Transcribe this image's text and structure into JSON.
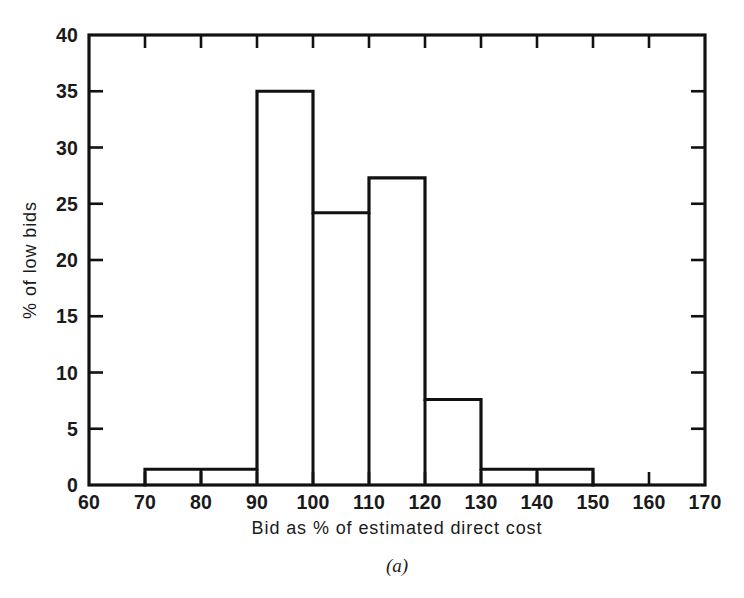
{
  "figure": {
    "caption": "(a)",
    "background_color": "#ffffff",
    "ink_color": "#111111"
  },
  "chart_data": {
    "type": "bar",
    "subtype": "histogram",
    "title": "",
    "subtitle": "",
    "xlabel": "Bid as % of estimated direct cost",
    "ylabel": "% of low bids",
    "xlim": [
      60,
      170
    ],
    "ylim": [
      0,
      40
    ],
    "x_tick_step": 10,
    "y_tick_step": 5,
    "grid": false,
    "legend": null,
    "bin_width": 10,
    "bin_edges": [
      60,
      70,
      80,
      90,
      100,
      110,
      120,
      130,
      140,
      150,
      160,
      170
    ],
    "categories": [
      "60-70",
      "70-80",
      "80-90",
      "90-100",
      "100-110",
      "110-120",
      "120-130",
      "130-140",
      "140-150",
      "150-160",
      "160-170"
    ],
    "values": [
      0,
      1.4,
      1.4,
      35.0,
      24.2,
      27.3,
      7.6,
      1.4,
      1.4,
      0,
      0
    ],
    "x_tick_labels": [
      "60",
      "70",
      "80",
      "90",
      "100",
      "110",
      "120",
      "130",
      "140",
      "150",
      "160",
      "170"
    ],
    "y_tick_labels": [
      "0",
      "5",
      "10",
      "15",
      "20",
      "25",
      "30",
      "35",
      "40"
    ],
    "x_ticks": [
      60,
      70,
      80,
      90,
      100,
      110,
      120,
      130,
      140,
      150,
      160,
      170
    ],
    "y_ticks": [
      0,
      5,
      10,
      15,
      20,
      25,
      30,
      35,
      40
    ],
    "annotations": []
  }
}
